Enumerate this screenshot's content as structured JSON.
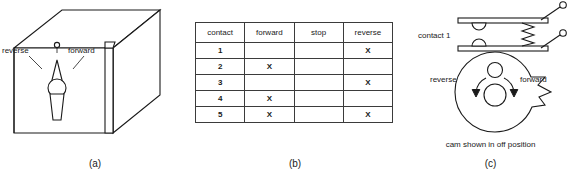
{
  "figure": {
    "panels": [
      {
        "id": "a",
        "caption": "(a)",
        "labels": {
          "reverse": "reverse",
          "forward": "forward"
        }
      },
      {
        "id": "b",
        "caption": "(b)",
        "table": {
          "headers": [
            "contact",
            "forward",
            "stop",
            "reverse"
          ],
          "rows": [
            {
              "contact": "1",
              "forward": "",
              "stop": "",
              "reverse": "X"
            },
            {
              "contact": "2",
              "forward": "X",
              "stop": "",
              "reverse": ""
            },
            {
              "contact": "3",
              "forward": "",
              "stop": "",
              "reverse": "X"
            },
            {
              "contact": "4",
              "forward": "X",
              "stop": "",
              "reverse": ""
            },
            {
              "contact": "5",
              "forward": "X",
              "stop": "",
              "reverse": "X"
            }
          ]
        }
      },
      {
        "id": "c",
        "caption": "(c)",
        "labels": {
          "contact": "contact 1",
          "reverse": "reverse",
          "forward": "forward",
          "note": "cam shown in off position"
        }
      }
    ]
  },
  "colors": {
    "ink": "#1a1a1a",
    "paper": "#ffffff",
    "rule": "#3b3b3b"
  }
}
